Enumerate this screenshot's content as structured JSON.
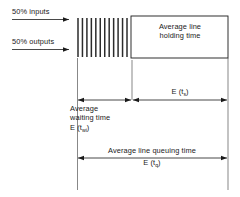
{
  "diagram": {
    "colors": {
      "stroke": "#1a1a1a",
      "background": "#ffffff",
      "hatch": "#2b2b2b"
    },
    "flow_labels": [
      {
        "id": "inputs",
        "text": "50% inputs"
      },
      {
        "id": "outputs",
        "text": "50% outputs"
      }
    ],
    "queue": {
      "name": "queue-hatch",
      "tick_count": 12
    },
    "server_box": {
      "line1": "Average line",
      "line2": "holding time"
    },
    "measures": {
      "waiting": {
        "line1": "Average",
        "line2": "waiting time",
        "symbol": "E (t",
        "subscript": "wi",
        "symbol_close": ")"
      },
      "holding": {
        "symbol": "E (t",
        "subscript": "s",
        "symbol_close": ")"
      },
      "queuing": {
        "caption": "Average line queuing time",
        "symbol": "E (t",
        "subscript": "q",
        "symbol_close": ")"
      }
    }
  }
}
